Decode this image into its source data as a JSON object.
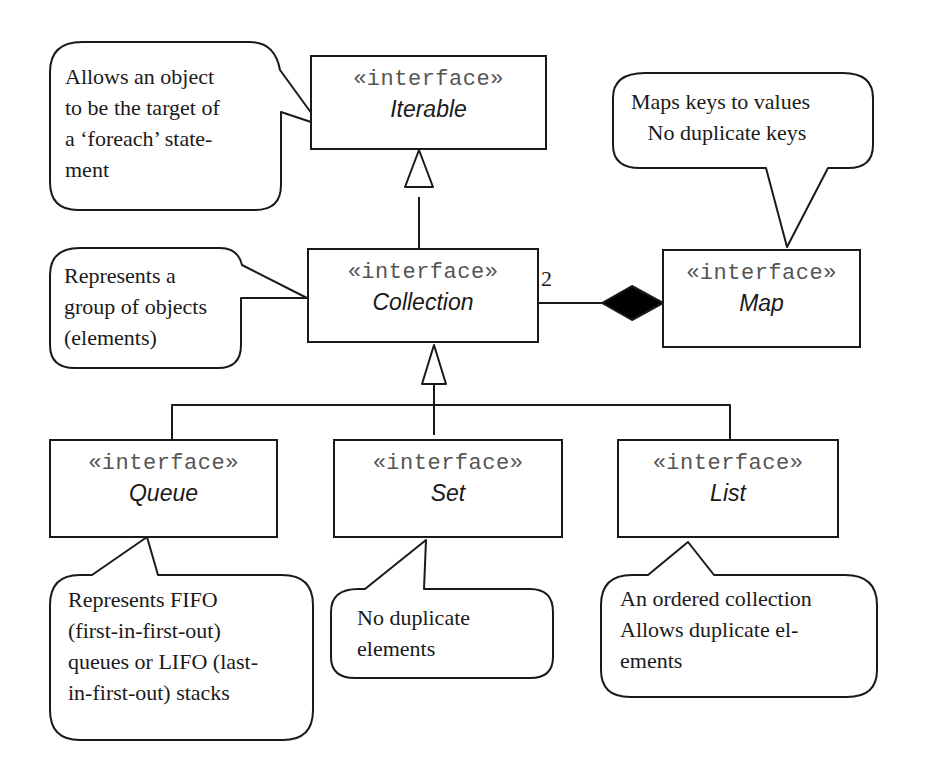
{
  "diagram": {
    "stereotype": "«interface»",
    "interfaces": {
      "iterable": {
        "name": "Iterable"
      },
      "collection": {
        "name": "Collection"
      },
      "map": {
        "name": "Map"
      },
      "queue": {
        "name": "Queue"
      },
      "set": {
        "name": "Set"
      },
      "list": {
        "name": "List"
      }
    },
    "relationships": {
      "collection_extends_iterable": {
        "type": "generalization",
        "from": "Collection",
        "to": "Iterable"
      },
      "queue_set_list_extend_collection": {
        "type": "generalization",
        "from": [
          "Queue",
          "Set",
          "List"
        ],
        "to": "Collection"
      },
      "map_collection_composition": {
        "type": "composition",
        "whole": "Map",
        "part": "Collection",
        "multiplicity": "2"
      }
    },
    "notes": {
      "iterable": "Allows an object\nto be the target of\na ‘foreach’ state-\nment",
      "map": "Maps keys to values\n   No duplicate keys",
      "collection": "Represents a\ngroup of objects\n(elements)",
      "queue": "Represents FIFO\n(first-in-first-out)\nqueues or LIFO (last-\nin-first-out) stacks",
      "set": "No duplicate\nelements",
      "list": "An ordered collection\nAllows duplicate el-\nements"
    },
    "colors": {
      "line": "#1a1a1a",
      "stereotype_text": "#555555",
      "background": "#ffffff"
    }
  }
}
